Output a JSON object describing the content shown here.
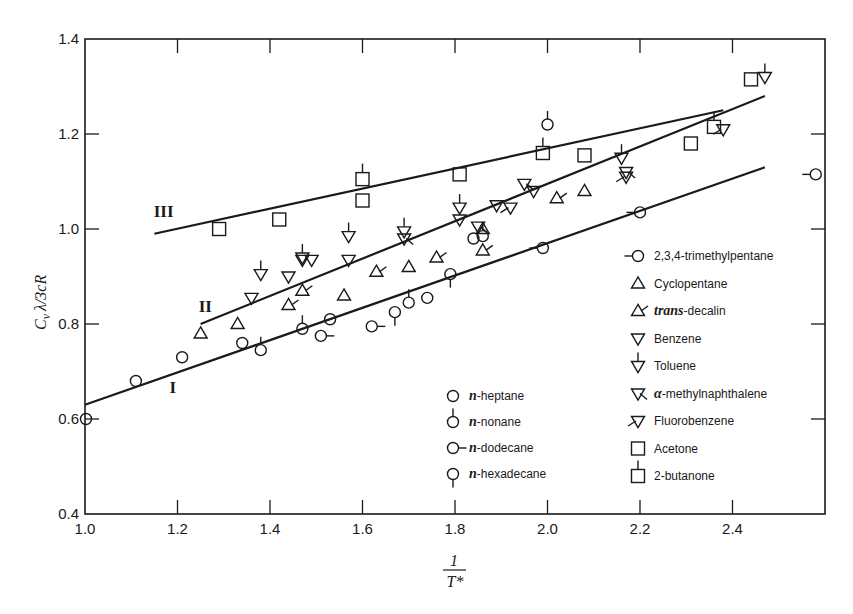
{
  "chart_data": {
    "type": "scatter",
    "title": "",
    "xlabel": "1/T*",
    "ylabel": "Cv λ/3cR",
    "xlim": [
      1.0,
      2.6
    ],
    "ylim": [
      0.4,
      1.4
    ],
    "x_ticks": [
      "1.0",
      "1.2",
      "1.4",
      "1.6",
      "1.8",
      "2.0",
      "2.2",
      "2.4"
    ],
    "y_ticks": [
      "0.4",
      "0.6",
      "0.8",
      "1.0",
      "1.2",
      "1.4"
    ],
    "grid": false,
    "legend_position": "lower right (inside)",
    "lines": [
      {
        "name": "I",
        "x": [
          1.0,
          2.47
        ],
        "y": [
          0.63,
          1.13
        ]
      },
      {
        "name": "II",
        "x": [
          1.25,
          2.47
        ],
        "y": [
          0.8,
          1.28
        ]
      },
      {
        "name": "III",
        "x": [
          1.15,
          2.38
        ],
        "y": [
          0.99,
          1.25
        ]
      }
    ],
    "line_labels": [
      {
        "text": "I",
        "x": 1.19,
        "y": 0.655
      },
      {
        "text": "II",
        "x": 1.26,
        "y": 0.825
      },
      {
        "text": "III",
        "x": 1.17,
        "y": 1.025
      }
    ],
    "series": [
      {
        "name": "n-heptane",
        "marker": "circle",
        "points": [
          [
            1.0,
            0.6
          ],
          [
            1.11,
            0.68
          ],
          [
            1.21,
            0.73
          ],
          [
            1.34,
            0.76
          ],
          [
            1.53,
            0.81
          ],
          [
            1.74,
            0.855
          ],
          [
            1.84,
            0.98
          ]
        ]
      },
      {
        "name": "n-nonane",
        "marker": "circle-stem-up",
        "points": [
          [
            1.38,
            0.745
          ],
          [
            1.47,
            0.79
          ],
          [
            1.7,
            0.845
          ],
          [
            1.86,
            0.985
          ],
          [
            2.0,
            1.22
          ]
        ]
      },
      {
        "name": "n-dodecane",
        "marker": "circle-stem-right",
        "points": [
          [
            1.51,
            0.775
          ],
          [
            1.62,
            0.795
          ]
        ]
      },
      {
        "name": "n-hexadecane",
        "marker": "circle-stem-down",
        "points": [
          [
            1.67,
            0.825
          ],
          [
            1.79,
            0.905
          ]
        ]
      },
      {
        "name": "2,3,4-trimethylpentane",
        "marker": "circle-stem-left",
        "points": [
          [
            1.99,
            0.96
          ],
          [
            2.2,
            1.035
          ],
          [
            2.58,
            1.115
          ]
        ]
      },
      {
        "name": "Cyclopentane",
        "marker": "triangle-up",
        "points": [
          [
            1.25,
            0.78
          ],
          [
            1.33,
            0.8
          ],
          [
            1.56,
            0.86
          ],
          [
            1.7,
            0.92
          ],
          [
            1.86,
            1.0
          ],
          [
            2.08,
            1.08
          ]
        ]
      },
      {
        "name": "trans-decalin",
        "marker": "triangle-up-flag",
        "points": [
          [
            1.44,
            0.84
          ],
          [
            1.47,
            0.87
          ],
          [
            1.63,
            0.91
          ],
          [
            1.76,
            0.94
          ],
          [
            1.86,
            0.955
          ],
          [
            2.02,
            1.065
          ]
        ]
      },
      {
        "name": "Benzene",
        "marker": "triangle-down",
        "points": [
          [
            1.36,
            0.855
          ],
          [
            1.44,
            0.9
          ],
          [
            1.47,
            0.935
          ],
          [
            1.49,
            0.935
          ],
          [
            1.57,
            0.935
          ],
          [
            1.81,
            1.02
          ],
          [
            1.89,
            1.05
          ],
          [
            1.97,
            1.08
          ]
        ]
      },
      {
        "name": "Toluene",
        "marker": "triangle-down-stem",
        "points": [
          [
            1.38,
            0.905
          ],
          [
            1.47,
            0.94
          ],
          [
            1.57,
            0.985
          ],
          [
            1.69,
            0.995
          ],
          [
            1.81,
            1.045
          ],
          [
            2.16,
            1.15
          ],
          [
            2.47,
            1.32
          ]
        ]
      },
      {
        "name": "α-methylnaphthalene",
        "marker": "triangle-down-flag",
        "points": [
          [
            1.69,
            0.98
          ],
          [
            1.85,
            1.005
          ],
          [
            1.95,
            1.095
          ],
          [
            2.17,
            1.12
          ]
        ]
      },
      {
        "name": "Fluorobenzene",
        "marker": "triangle-down-flag-left",
        "points": [
          [
            1.92,
            1.045
          ],
          [
            2.17,
            1.11
          ],
          [
            2.38,
            1.21
          ]
        ]
      },
      {
        "name": "Acetone",
        "marker": "square",
        "points": [
          [
            1.29,
            1.0
          ],
          [
            1.42,
            1.02
          ],
          [
            1.6,
            1.06
          ],
          [
            1.81,
            1.115
          ],
          [
            2.08,
            1.155
          ],
          [
            2.31,
            1.18
          ],
          [
            2.44,
            1.315
          ]
        ]
      },
      {
        "name": "2-butanone",
        "marker": "square-stem-up",
        "points": [
          [
            1.6,
            1.105
          ],
          [
            1.99,
            1.16
          ],
          [
            2.36,
            1.215
          ]
        ]
      }
    ]
  },
  "legend_left": [
    {
      "label_prefix": "n",
      "label": "-heptane",
      "marker": "circle"
    },
    {
      "label_prefix": "n",
      "label": "-nonane",
      "marker": "circle-stem-up"
    },
    {
      "label_prefix": "n",
      "label": "-dodecane",
      "marker": "circle-stem-right"
    },
    {
      "label_prefix": "n",
      "label": "-hexadecane",
      "marker": "circle-stem-down"
    }
  ],
  "legend_right": [
    {
      "label": "2,3,4-trimethylpentane",
      "marker": "circle-stem-left"
    },
    {
      "label": "Cyclopentane",
      "marker": "triangle-up"
    },
    {
      "label_prefix": "trans",
      "label": "-decalin",
      "marker": "triangle-up-flag"
    },
    {
      "label": "Benzene",
      "marker": "triangle-down"
    },
    {
      "label": "Toluene",
      "marker": "triangle-down-stem"
    },
    {
      "label_prefix": "α",
      "label": "-methylnaphthalene",
      "marker": "triangle-down-flag"
    },
    {
      "label": "Fluorobenzene",
      "marker": "triangle-down-flag-left"
    },
    {
      "label": "Acetone",
      "marker": "square"
    },
    {
      "label": "2-butanone",
      "marker": "square-stem-up"
    }
  ],
  "axis": {
    "x_label_num": "1",
    "x_label_den": "T*",
    "y_label_main": "C",
    "y_label_sub": "v",
    "y_label_frac": "λ/3cR"
  },
  "colors": {
    "ink": "#1a1a1a",
    "background": "#ffffff"
  }
}
